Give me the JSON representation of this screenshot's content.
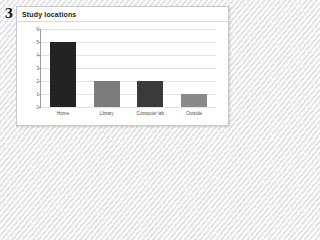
{
  "question_number": "3",
  "panel": {
    "title": "Study locations"
  },
  "chart_data": {
    "type": "bar",
    "title": "Study locations",
    "xlabel": "",
    "ylabel": "",
    "categories": [
      "Home",
      "Library",
      "Computer lab",
      "Outside"
    ],
    "values": [
      5,
      2,
      2,
      1
    ],
    "bar_colors": [
      "#232323",
      "#7c7c7c",
      "#3a3a3a",
      "#8a8a8a"
    ],
    "ylim": [
      0,
      6
    ],
    "yticks": [
      0,
      1,
      2,
      3,
      4,
      5,
      6
    ],
    "ytick_labels": [
      "0",
      "1",
      "2",
      "3",
      "4",
      "5",
      "6"
    ],
    "grid": true,
    "legend": false
  },
  "colors": {
    "panel_background": "#ffffff",
    "panel_border": "#c9c9cc",
    "axis": "#9b9b9e",
    "gridline": "#e3e3e6",
    "tick_text": "#5a5a5e",
    "title_text": "#1c1c1c",
    "page_background": "#f2f2f2"
  }
}
